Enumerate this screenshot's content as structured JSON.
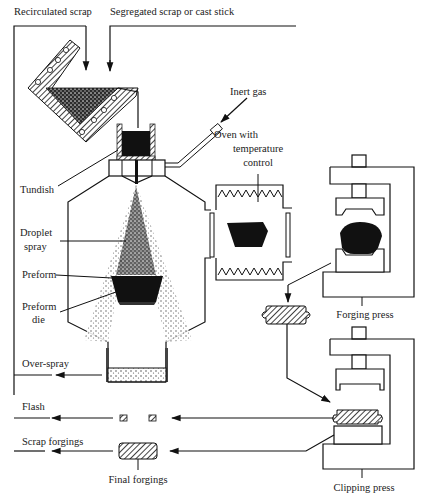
{
  "diagram": {
    "labels": {
      "recirculated_scrap": "Recirculated  scrap",
      "segregated_scrap": "Segregated scrap or cast stick",
      "inert_gas": "Inert gas",
      "oven_line1": "Oven with",
      "oven_line2": "temperature",
      "oven_line3": "control",
      "tundish": "Tundish",
      "droplet_line1": "Droplet",
      "droplet_line2": "spray",
      "preform": "Preform",
      "preform_die_line1": "Preform",
      "preform_die_line2": "die",
      "forging_press": "Forging press",
      "over_spray": "Over-spray",
      "flash": "Flash",
      "scrap_forgings": "Scrap forgings",
      "final_forgings": "Final forgings",
      "clipping_press": "Clipping press"
    },
    "colors": {
      "line": "#111111",
      "background": "#ffffff",
      "text": "#222222"
    }
  }
}
